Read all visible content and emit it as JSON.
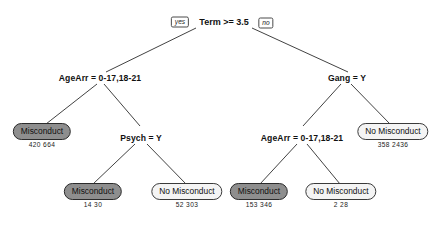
{
  "diagram": {
    "type": "decision-tree",
    "root": {
      "label": "Term >= 3.5",
      "yes_tag": "yes",
      "no_tag": "no"
    },
    "splits": [
      {
        "id": "agearr-left",
        "label": "AgeArr = 0-17,18-21"
      },
      {
        "id": "psych",
        "label": "Psych = Y"
      },
      {
        "id": "gang",
        "label": "Gang = Y"
      },
      {
        "id": "agearr-right",
        "label": "AgeArr = 0-17,18-21"
      }
    ],
    "leaves": [
      {
        "id": "leaf-1",
        "label": "Misconduct",
        "shaded": true,
        "counts": "420  664",
        "n1": 420,
        "n2": 664
      },
      {
        "id": "leaf-2",
        "label": "Misconduct",
        "shaded": true,
        "counts": "14  30",
        "n1": 14,
        "n2": 30
      },
      {
        "id": "leaf-3",
        "label": "No Misconduct",
        "shaded": false,
        "counts": "52  303",
        "n1": 52,
        "n2": 303
      },
      {
        "id": "leaf-4",
        "label": "Misconduct",
        "shaded": true,
        "counts": "153  346",
        "n1": 153,
        "n2": 346
      },
      {
        "id": "leaf-5",
        "label": "No Misconduct",
        "shaded": false,
        "counts": "2  28",
        "n1": 2,
        "n2": 28
      },
      {
        "id": "leaf-6",
        "label": "No Misconduct",
        "shaded": false,
        "counts": "358  2436",
        "n1": 358,
        "n2": 2436
      }
    ],
    "colors": {
      "shaded_fill": "#8e8e8e",
      "plain_fill": "#f4f4f4",
      "stroke": "#3a3a3a",
      "text": "#101010",
      "background": "#ffffff"
    }
  }
}
